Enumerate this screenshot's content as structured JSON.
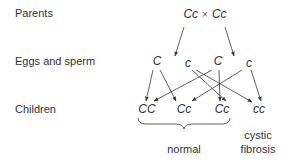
{
  "diagram": {
    "row_labels": {
      "parents": "Parents",
      "gametes": "Eggs and sperm",
      "children": "Children"
    },
    "parents": {
      "left": "Cc",
      "cross_symbol": "×",
      "right": "Cc"
    },
    "gametes": [
      "C",
      "c",
      "C",
      "c"
    ],
    "children": [
      "CC",
      "Cc",
      "Cc",
      "cc"
    ],
    "captions": {
      "normal": "normal",
      "cystic_line1": "cystic",
      "cystic_line2": "fibrosis"
    },
    "arrows": [
      {
        "from": "parent-left",
        "to": "gamete-1"
      },
      {
        "from": "parent-right",
        "to": "gamete-4"
      },
      {
        "from": "gamete-1",
        "to": "child-1"
      },
      {
        "from": "gamete-1",
        "to": "child-2"
      },
      {
        "from": "gamete-2",
        "to": "child-3"
      },
      {
        "from": "gamete-2",
        "to": "child-4"
      },
      {
        "from": "gamete-3",
        "to": "child-1"
      },
      {
        "from": "gamete-3",
        "to": "child-3"
      },
      {
        "from": "gamete-4",
        "to": "child-2"
      },
      {
        "from": "gamete-4",
        "to": "child-4"
      }
    ],
    "colors": {
      "line": "#3a3a3a",
      "text": "#333333"
    }
  }
}
